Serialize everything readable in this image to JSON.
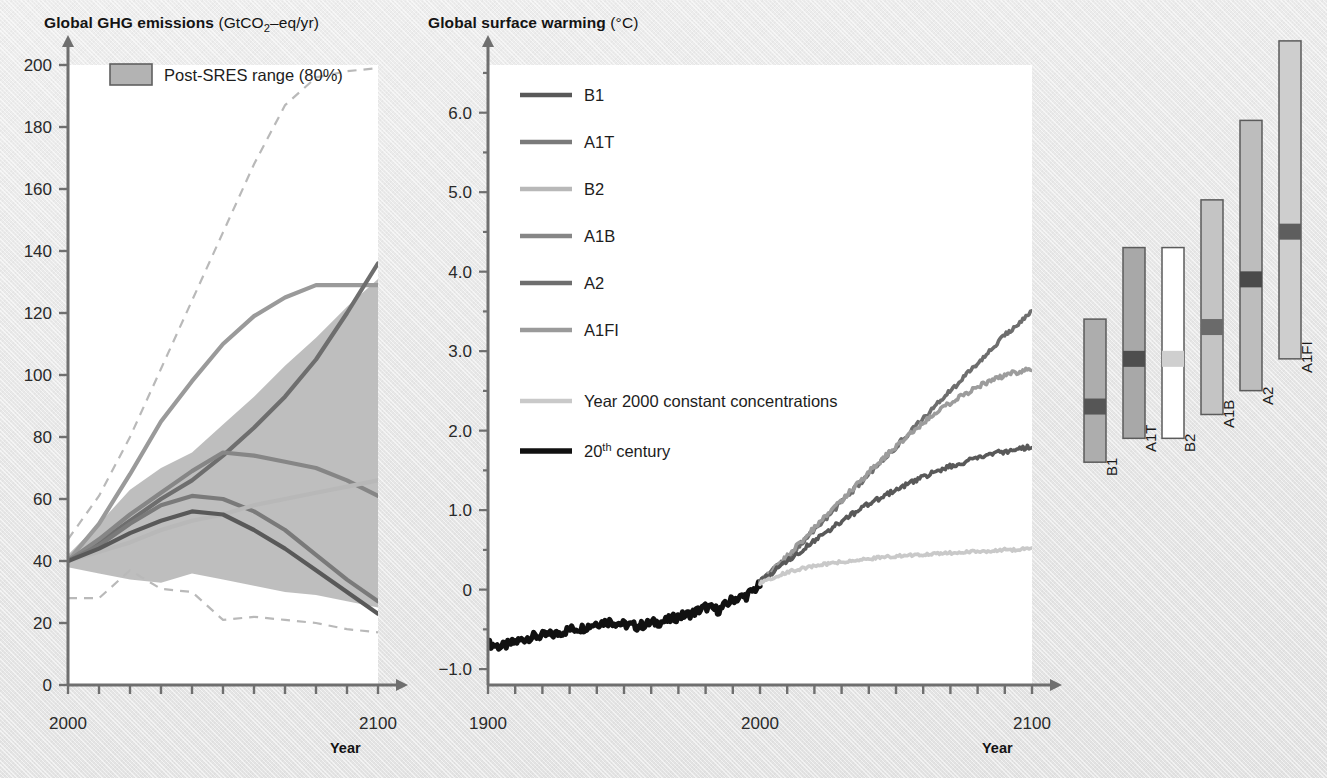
{
  "figure": {
    "background_color": "#e8e8e8",
    "panel_background": "#ffffff"
  },
  "left_panel": {
    "title_bold": "Global GHG emissions",
    "title_unit_prefix": "(GtCO",
    "title_unit_sub": "2",
    "title_unit_suffix": "–eq/yr)",
    "legend_label": "Post-SRES range (80%)",
    "axis_title": "Year",
    "y_ticks": [
      "200",
      "180",
      "160",
      "140",
      "120",
      "100",
      "80",
      "60",
      "40",
      "20",
      "0"
    ],
    "x_ticks": [
      "2000",
      "2100"
    ]
  },
  "right_panel": {
    "title_bold": "Global surface warming",
    "title_unit": "(°C)",
    "axis_title": "Year",
    "y_ticks": [
      "6.0",
      "5.0",
      "4.0",
      "3.0",
      "2.0",
      "1.0",
      "0",
      "−1.0"
    ],
    "x_ticks": [
      "1900",
      "2000",
      "2100"
    ],
    "legend": [
      {
        "label": "B1",
        "color": "#595959"
      },
      {
        "label": "A1T",
        "color": "#7a7a7a"
      },
      {
        "label": "B2",
        "color": "#b8b8b8"
      },
      {
        "label": "A1B",
        "color": "#868686"
      },
      {
        "label": "A2",
        "color": "#6e6e6e"
      },
      {
        "label": "A1FI",
        "color": "#9a9a9a"
      },
      {
        "label": "Year 2000 constant concentrations",
        "color": "#c9c9c9"
      },
      {
        "label": "20th century",
        "color": "#111111",
        "sup": "th"
      }
    ]
  },
  "bar_panel": {
    "bars": [
      {
        "label": "B1",
        "low": 1.1,
        "high": 2.9,
        "best": 1.8,
        "fill": "#adadad",
        "marker": "#565656"
      },
      {
        "label": "A1T",
        "low": 1.4,
        "high": 3.8,
        "best": 2.4,
        "fill": "#a8a8a8",
        "marker": "#4e4e4e"
      },
      {
        "label": "B2",
        "low": 1.4,
        "high": 3.8,
        "best": 2.4,
        "fill": "#ffffff",
        "marker": "#cfcfcf"
      },
      {
        "label": "A1B",
        "low": 1.7,
        "high": 4.4,
        "best": 2.8,
        "fill": "#c4c4c4",
        "marker": "#6a6a6a"
      },
      {
        "label": "A2",
        "low": 2.0,
        "high": 5.4,
        "best": 3.4,
        "fill": "#bdbdbd",
        "marker": "#4a4a4a"
      },
      {
        "label": "A1FI",
        "low": 2.4,
        "high": 6.4,
        "best": 4.0,
        "fill": "#cecece",
        "marker": "#5e5e5e"
      }
    ]
  },
  "chart_data": [
    {
      "type": "line",
      "title": "Global GHG emissions (GtCO2-eq/yr)",
      "xlabel": "Year",
      "ylabel": "GtCO2-eq/yr",
      "xlim": [
        2000,
        2100
      ],
      "ylim": [
        0,
        200
      ],
      "ytick_step": 20,
      "xtick_step": 10,
      "grid": false,
      "legend_entries": [
        "Post-SRES range (80%)"
      ],
      "band": {
        "name": "Post-SRES range (80%)",
        "color": "#b3b3b3",
        "x": [
          2000,
          2010,
          2020,
          2030,
          2040,
          2050,
          2060,
          2070,
          2080,
          2090,
          2100
        ],
        "upper": [
          42,
          52,
          63,
          70,
          75,
          84,
          93,
          103,
          112,
          122,
          131
        ],
        "lower": [
          38,
          36,
          34,
          33,
          36,
          34,
          32,
          30,
          29,
          27,
          25
        ]
      },
      "dashed_bounds": [
        {
          "name": "upper 95th",
          "style": "dashed",
          "color": "#b9b9b9",
          "x": [
            2000,
            2010,
            2020,
            2030,
            2040,
            2050,
            2060,
            2070,
            2080,
            2090,
            2100
          ],
          "y": [
            47,
            61,
            80,
            102,
            124,
            146,
            168,
            187,
            196,
            198,
            199
          ]
        },
        {
          "name": "lower 5th",
          "style": "dashed",
          "color": "#b9b9b9",
          "x": [
            2000,
            2010,
            2020,
            2030,
            2040,
            2050,
            2060,
            2070,
            2080,
            2090,
            2100
          ],
          "y": [
            28,
            28,
            37,
            31,
            30,
            21,
            22,
            21,
            20,
            18,
            17
          ]
        }
      ],
      "series": [
        {
          "name": "A1FI",
          "color": "#9a9a9a",
          "x": [
            2000,
            2010,
            2020,
            2030,
            2040,
            2050,
            2060,
            2070,
            2080,
            2090,
            2100
          ],
          "y": [
            40,
            52,
            68,
            85,
            98,
            110,
            119,
            125,
            129,
            129,
            129
          ]
        },
        {
          "name": "A2",
          "color": "#6e6e6e",
          "x": [
            2000,
            2010,
            2020,
            2030,
            2040,
            2050,
            2060,
            2070,
            2080,
            2090,
            2100
          ],
          "y": [
            40,
            46,
            53,
            60,
            66,
            74,
            83,
            93,
            105,
            120,
            136
          ]
        },
        {
          "name": "A1B",
          "color": "#868686",
          "x": [
            2000,
            2010,
            2020,
            2030,
            2040,
            2050,
            2060,
            2070,
            2080,
            2090,
            2100
          ],
          "y": [
            40,
            47,
            55,
            62,
            69,
            75,
            74,
            72,
            70,
            66,
            61
          ]
        },
        {
          "name": "A1T",
          "color": "#7a7a7a",
          "x": [
            2000,
            2010,
            2020,
            2030,
            2040,
            2050,
            2060,
            2070,
            2080,
            2090,
            2100
          ],
          "y": [
            40,
            45,
            52,
            58,
            61,
            60,
            56,
            50,
            42,
            34,
            27
          ]
        },
        {
          "name": "B2",
          "color": "#b8b8b8",
          "x": [
            2000,
            2010,
            2020,
            2030,
            2040,
            2050,
            2060,
            2070,
            2080,
            2090,
            2100
          ],
          "y": [
            40,
            43,
            46,
            50,
            53,
            55,
            58,
            60,
            62,
            64,
            66
          ]
        },
        {
          "name": "B1",
          "color": "#595959",
          "x": [
            2000,
            2010,
            2020,
            2030,
            2040,
            2050,
            2060,
            2070,
            2080,
            2090,
            2100
          ],
          "y": [
            40,
            44,
            49,
            53,
            56,
            55,
            50,
            44,
            37,
            30,
            23
          ]
        }
      ]
    },
    {
      "type": "line",
      "title": "Global surface warming (°C)",
      "xlabel": "Year",
      "ylabel": "°C",
      "xlim": [
        1900,
        2100
      ],
      "ylim": [
        -1.2,
        6.6
      ],
      "ytick_step": 1.0,
      "yminor_step": 0.5,
      "xtick_step": 10,
      "grid": false,
      "series": [
        {
          "name": "20th century",
          "color": "#111111",
          "x": [
            1900,
            1905,
            1910,
            1915,
            1920,
            1925,
            1930,
            1935,
            1940,
            1945,
            1950,
            1955,
            1960,
            1965,
            1970,
            1975,
            1980,
            1985,
            1990,
            1995,
            2000
          ],
          "y": [
            -0.68,
            -0.72,
            -0.66,
            -0.6,
            -0.58,
            -0.56,
            -0.5,
            -0.48,
            -0.42,
            -0.4,
            -0.44,
            -0.46,
            -0.42,
            -0.4,
            -0.34,
            -0.3,
            -0.22,
            -0.26,
            -0.12,
            -0.08,
            0.06
          ]
        },
        {
          "name": "A2",
          "color": "#6e6e6e",
          "x": [
            2000,
            2010,
            2020,
            2030,
            2040,
            2050,
            2060,
            2070,
            2080,
            2090,
            2100
          ],
          "y": [
            0.1,
            0.4,
            0.75,
            1.1,
            1.45,
            1.8,
            2.15,
            2.5,
            2.85,
            3.2,
            3.5
          ]
        },
        {
          "name": "A1B",
          "color": "#9c9c9c",
          "x": [
            2000,
            2010,
            2020,
            2030,
            2040,
            2050,
            2060,
            2070,
            2080,
            2090,
            2100
          ],
          "y": [
            0.1,
            0.42,
            0.78,
            1.12,
            1.48,
            1.8,
            2.1,
            2.35,
            2.55,
            2.7,
            2.78
          ]
        },
        {
          "name": "B1",
          "color": "#595959",
          "x": [
            2000,
            2010,
            2020,
            2030,
            2040,
            2050,
            2060,
            2070,
            2080,
            2090,
            2100
          ],
          "y": [
            0.1,
            0.36,
            0.62,
            0.86,
            1.08,
            1.26,
            1.42,
            1.55,
            1.66,
            1.74,
            1.8
          ]
        },
        {
          "name": "Year 2000 constant concentrations",
          "color": "#c9c9c9",
          "x": [
            2000,
            2010,
            2020,
            2030,
            2040,
            2050,
            2060,
            2070,
            2080,
            2090,
            2100
          ],
          "y": [
            0.08,
            0.22,
            0.3,
            0.35,
            0.39,
            0.42,
            0.44,
            0.46,
            0.48,
            0.5,
            0.51
          ]
        }
      ]
    },
    {
      "type": "bar",
      "title": "Projected surface warming by scenario (2090–2099 relative to 1980–1999)",
      "categories": [
        "B1",
        "A1T",
        "B2",
        "A1B",
        "A2",
        "A1FI"
      ],
      "likely_range_low": [
        1.1,
        1.4,
        1.4,
        1.7,
        2.0,
        2.4
      ],
      "likely_range_high": [
        2.9,
        3.8,
        3.8,
        4.4,
        5.4,
        6.4
      ],
      "best_estimate": [
        1.8,
        2.4,
        2.4,
        2.8,
        3.4,
        4.0
      ],
      "ylabel": "°C"
    }
  ]
}
